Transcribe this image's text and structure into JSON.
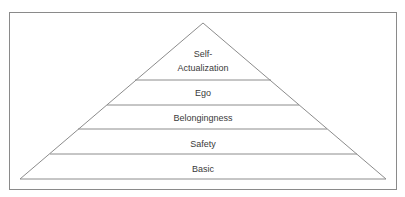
{
  "diagram": {
    "type": "pyramid",
    "colors": {
      "frame": "#8a8a8a",
      "lines": "#8c8c8c",
      "text": "#3a3a3a",
      "background": "#ffffff"
    },
    "levels_top_to_bottom": [
      {
        "id": "self-actualization",
        "lines": [
          "Self-",
          "Actualization"
        ]
      },
      {
        "id": "ego",
        "lines": [
          "Ego"
        ]
      },
      {
        "id": "belongingness",
        "lines": [
          "Belongingness"
        ]
      },
      {
        "id": "safety",
        "lines": [
          "Safety"
        ]
      },
      {
        "id": "basic",
        "lines": [
          "Basic"
        ]
      }
    ]
  }
}
